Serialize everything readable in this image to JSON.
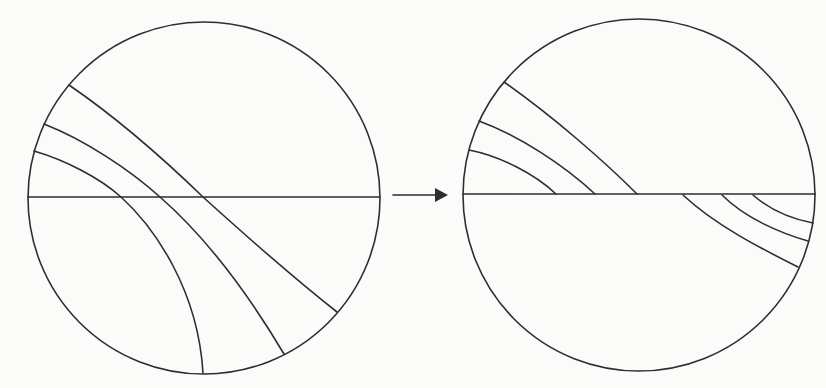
{
  "figure": {
    "panels": [
      {
        "id": "before",
        "label": "before",
        "curves": [
          {
            "id": "curve-a",
            "role": "outer"
          },
          {
            "id": "curve-b",
            "role": "middle"
          },
          {
            "id": "curve-c",
            "role": "inner"
          }
        ]
      },
      {
        "id": "after",
        "label": "after",
        "upper_curves": [
          {
            "id": "curve-a",
            "role": "outer"
          },
          {
            "id": "curve-b",
            "role": "middle"
          },
          {
            "id": "curve-c",
            "role": "inner"
          }
        ],
        "lower_curves": [
          {
            "id": "curve-d",
            "role": "outer"
          },
          {
            "id": "curve-e",
            "role": "middle"
          },
          {
            "id": "curve-f",
            "role": "inner"
          }
        ]
      }
    ],
    "connector": {
      "icon": "arrow-right-icon"
    },
    "colors": {
      "stroke": "#2e2e2e",
      "background": "#fbfbfa"
    }
  }
}
